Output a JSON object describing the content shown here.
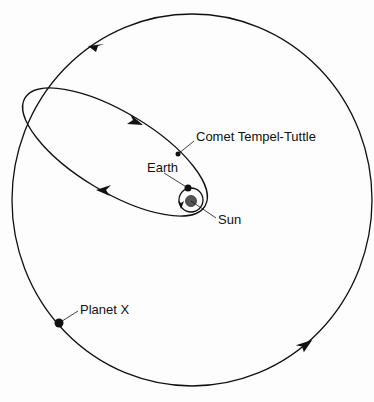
{
  "diagram": {
    "type": "orbital diagram",
    "labels": {
      "comet": "Comet Tempel-Tuttle",
      "earth": "Earth",
      "sun": "Sun",
      "planet": "Planet X"
    },
    "bodies": [
      {
        "name": "Sun",
        "description": "central star inside Earth's small circular orbit"
      },
      {
        "name": "Earth",
        "description": "planet on small circular orbit around Sun"
      },
      {
        "name": "Comet Tempel-Tuttle",
        "description": "body on elongated elliptical orbit"
      },
      {
        "name": "Planet X",
        "description": "planet on large circular orbit"
      }
    ],
    "orbits": [
      {
        "name": "Earth orbit",
        "shape": "circle",
        "direction": "counterclockwise arrow"
      },
      {
        "name": "Comet Tempel-Tuttle orbit",
        "shape": "ellipse",
        "direction": "arrows indicate motion along ellipse"
      },
      {
        "name": "Planet X orbit",
        "shape": "large circle",
        "direction": "arrows indicate counterclockwise motion"
      }
    ],
    "colors": {
      "line": "#111111",
      "sun": "#555555",
      "background": "#fdfdfd"
    }
  }
}
